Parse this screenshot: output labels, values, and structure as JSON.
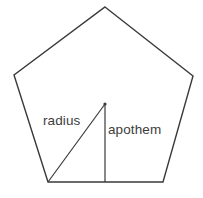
{
  "figure": {
    "kind": "geometry-diagram",
    "shape_name": "regular-pentagon",
    "background_color": "#ffffff",
    "stroke_color": "#3a3a3a",
    "stroke_width": 1.4,
    "fill_color": "none",
    "text_color": "#3d3d3d",
    "width": 203,
    "height": 198
  },
  "labels": {
    "radius": "radius",
    "apothem": "apothem"
  },
  "geometry": {
    "pentagon_points": "105,7 193,76 163,182 48,182 14,75",
    "vertices": [
      {
        "name": "apex",
        "x": 105,
        "y": 7
      },
      {
        "name": "right",
        "x": 193,
        "y": 76
      },
      {
        "name": "bottom-right",
        "x": 163,
        "y": 182
      },
      {
        "name": "bottom-left",
        "x": 48,
        "y": 182
      },
      {
        "name": "left",
        "x": 14,
        "y": 75
      }
    ],
    "center": {
      "x": 105,
      "y": 104
    },
    "radius_line": {
      "x1": 105,
      "y1": 104,
      "x2": 48,
      "y2": 182
    },
    "apothem_line": {
      "x1": 105,
      "y1": 104,
      "x2": 105,
      "y2": 182
    },
    "center_dot_radius": 1.6
  }
}
